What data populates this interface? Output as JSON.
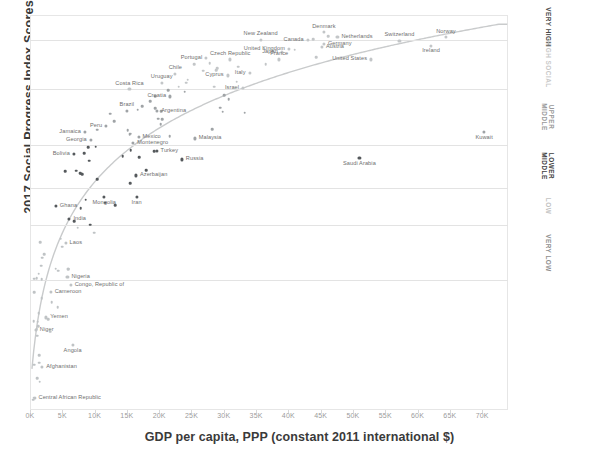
{
  "axes": {
    "y_title": "2017 Social Progress Index  Scores",
    "x_title": "GDP per capita, PPP (constant 2011 international $)",
    "right_title": "Social Progress Index Tiers",
    "x_ticks": [
      "0K",
      "5K",
      "10K",
      "15K",
      "20K",
      "25K",
      "30K",
      "35K",
      "40K",
      "45K",
      "50K",
      "55K",
      "60K",
      "65K",
      "70K"
    ]
  },
  "tiers": [
    {
      "label": "VERY HIGH",
      "color": "#4a4a4a"
    },
    {
      "label": "HIGH SOCIAL",
      "color": "#c9c9c9"
    },
    {
      "label": "UPPER\nMIDDLE",
      "color": "#9a9a9a"
    },
    {
      "label": "LOWER\nMIDDLE",
      "color": "#3f3f3f"
    },
    {
      "label": "LOW",
      "color": "#c2c2c2"
    },
    {
      "label": "VERY LOW",
      "color": "#8f8f8f"
    }
  ],
  "chart_data": {
    "type": "scatter",
    "title": "",
    "xlabel": "GDP per capita, PPP (constant 2011 international $)",
    "ylabel": "2017 Social Progress Index  Scores",
    "xlim": [
      0,
      74000
    ],
    "ylim": [
      28,
      92
    ],
    "grid": true,
    "legend": "none",
    "tier_boundaries": [
      88.0,
      80.0,
      71.0,
      64.0,
      58.0,
      49.0
    ],
    "trend": "logarithmic fit through all points",
    "points": [
      {
        "label": "Norway",
        "x": 64400,
        "y": 88.4,
        "lp": "above"
      },
      {
        "label": "Switzerland",
        "x": 57200,
        "y": 87.8,
        "lp": "above"
      },
      {
        "label": "Denmark",
        "x": 45500,
        "y": 89.2,
        "lp": "above"
      },
      {
        "label": "Netherlands",
        "x": 47600,
        "y": 88.4,
        "lp": "right"
      },
      {
        "label": "Canada",
        "x": 43000,
        "y": 88.0,
        "lp": "left"
      },
      {
        "label": "Germany",
        "x": 45500,
        "y": 87.3,
        "lp": "right"
      },
      {
        "label": "Austria",
        "x": 45200,
        "y": 86.8,
        "lp": "right"
      },
      {
        "label": "United Kingdom",
        "x": 40100,
        "y": 86.5,
        "lp": "left"
      },
      {
        "label": "Japan",
        "x": 39000,
        "y": 86.0,
        "lp": "left"
      },
      {
        "label": "New Zealand",
        "x": 35700,
        "y": 88.0,
        "lp": "above"
      },
      {
        "label": "Ireland",
        "x": 62100,
        "y": 87.0,
        "lp": "below"
      },
      {
        "label": "United States",
        "x": 52800,
        "y": 84.8,
        "lp": "left"
      },
      {
        "label": "France",
        "x": 38600,
        "y": 84.8,
        "lp": "above"
      },
      {
        "label": "Czech Republic",
        "x": 31000,
        "y": 84.8,
        "lp": "above"
      },
      {
        "label": "Portugal",
        "x": 27300,
        "y": 85.0,
        "lp": "left"
      },
      {
        "label": "Italy",
        "x": 34000,
        "y": 82.6,
        "lp": "left"
      },
      {
        "label": "Cyprus",
        "x": 30600,
        "y": 82.2,
        "lp": "left"
      },
      {
        "label": "Chile",
        "x": 22500,
        "y": 82.5,
        "lp": "above"
      },
      {
        "label": "Uruguay",
        "x": 20400,
        "y": 81.0,
        "lp": "above"
      },
      {
        "label": "Israel",
        "x": 33000,
        "y": 80.2,
        "lp": "left"
      },
      {
        "label": "Costa Rica",
        "x": 15400,
        "y": 80.0,
        "lp": "above"
      },
      {
        "label": "Croatia",
        "x": 21700,
        "y": 78.8,
        "lp": "left"
      },
      {
        "label": "Argentina",
        "x": 19700,
        "y": 76.5,
        "lp": "right"
      },
      {
        "label": "Brazil",
        "x": 15000,
        "y": 76.5,
        "lp": "above"
      },
      {
        "label": "Peru",
        "x": 11800,
        "y": 74.0,
        "lp": "left"
      },
      {
        "label": "Jamaica",
        "x": 8500,
        "y": 73.0,
        "lp": "left"
      },
      {
        "label": "Georgia",
        "x": 9400,
        "y": 71.8,
        "lp": "left"
      },
      {
        "label": "Mexico",
        "x": 16800,
        "y": 72.2,
        "lp": "right"
      },
      {
        "label": "Montenegro",
        "x": 16000,
        "y": 71.2,
        "lp": "right"
      },
      {
        "label": "Malaysia",
        "x": 25500,
        "y": 72.0,
        "lp": "right"
      },
      {
        "label": "Kuwait",
        "x": 70300,
        "y": 73.0,
        "lp": "below"
      },
      {
        "label": "Turkey",
        "x": 19600,
        "y": 70.0,
        "lp": "right"
      },
      {
        "label": "Bolivia",
        "x": 6800,
        "y": 69.5,
        "lp": "left"
      },
      {
        "label": "Russia",
        "x": 23500,
        "y": 68.6,
        "lp": "right"
      },
      {
        "label": "Saudi Arabia",
        "x": 51000,
        "y": 68.8,
        "lp": "below"
      },
      {
        "label": "Azerbaijan",
        "x": 16400,
        "y": 66.0,
        "lp": "right"
      },
      {
        "label": "Mongolia",
        "x": 11500,
        "y": 62.5,
        "lp": "below"
      },
      {
        "label": "Iran",
        "x": 16500,
        "y": 62.5,
        "lp": "below"
      },
      {
        "label": "Ghana",
        "x": 4000,
        "y": 61.0,
        "lp": "right"
      },
      {
        "label": "India",
        "x": 6100,
        "y": 59.0,
        "lp": "right"
      },
      {
        "label": "Laos",
        "x": 5500,
        "y": 55.0,
        "lp": "right"
      },
      {
        "label": "Nigeria",
        "x": 5800,
        "y": 49.5,
        "lp": "right"
      },
      {
        "label": "Congo, Republic of",
        "x": 6300,
        "y": 48.3,
        "lp": "right"
      },
      {
        "label": "Cameroon",
        "x": 3200,
        "y": 47.2,
        "lp": "right"
      },
      {
        "label": "Yemen",
        "x": 2500,
        "y": 43.0,
        "lp": "right"
      },
      {
        "label": "Niger",
        "x": 900,
        "y": 41.0,
        "lp": "right"
      },
      {
        "label": "Angola",
        "x": 6600,
        "y": 38.5,
        "lp": "below"
      },
      {
        "label": "Afghanistan",
        "x": 1900,
        "y": 35.0,
        "lp": "right"
      },
      {
        "label": "Central African Republic",
        "x": 700,
        "y": 30.0,
        "lp": "right"
      }
    ],
    "unlabeled_count": 79
  }
}
